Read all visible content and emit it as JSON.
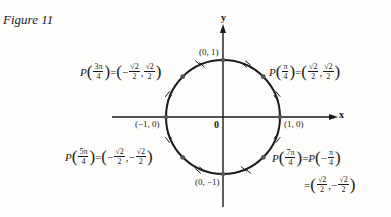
{
  "figure": {
    "title": "Figure 11"
  },
  "axes": {
    "x_label": "x",
    "y_label": "y",
    "origin_label": "0"
  },
  "intercepts": {
    "top": "(0, 1)",
    "left": "(−1, 0)",
    "right": "(1, 0)",
    "bottom": "(0, −1)"
  },
  "points": {
    "p_pi_4": {
      "P": "P",
      "arg_num": "π",
      "arg_den": "4",
      "eq": "=",
      "x_sign": "",
      "x_num": "√2",
      "x_den": "2",
      "sep": ",",
      "y_sign": "",
      "y_num": "√2",
      "y_den": "2"
    },
    "p_3pi_4": {
      "P": "P",
      "arg_num": "3π",
      "arg_den": "4",
      "eq": "=",
      "x_sign": "−",
      "x_num": "√2",
      "x_den": "2",
      "sep": ",",
      "y_sign": "",
      "y_num": "√2",
      "y_den": "2"
    },
    "p_5pi_4": {
      "P": "P",
      "arg_num": "5π",
      "arg_den": "4",
      "eq": "=",
      "x_sign": "−",
      "x_num": "√2",
      "x_den": "2",
      "sep": ",",
      "y_sign": "−",
      "y_num": "√2",
      "y_den": "2"
    },
    "p_7pi_4": {
      "P": "P",
      "arg_num": "7π",
      "arg_den": "4",
      "eq": "=",
      "P2": "P",
      "neg": "−",
      "arg2_num": "π",
      "arg2_den": "4",
      "eq2": "=",
      "x_sign": "",
      "x_num": "√2",
      "x_den": "2",
      "sep": ",",
      "y_sign": "−",
      "y_num": "√2",
      "y_den": "2"
    }
  },
  "colors": {
    "ink": "#1a1a1a",
    "point": "#555555",
    "background": "#fdfdfb"
  }
}
